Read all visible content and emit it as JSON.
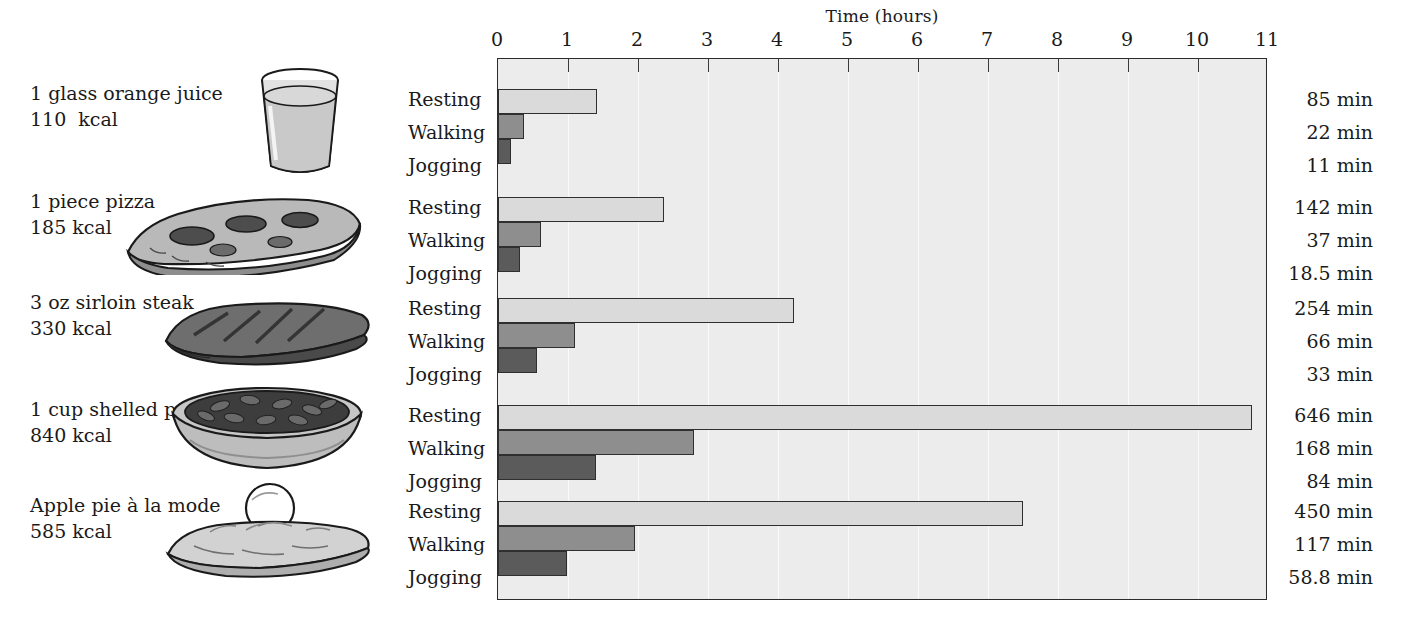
{
  "chart_data": {
    "type": "bar",
    "orientation": "horizontal",
    "title": "Time (hours)",
    "xlabel": "Time (hours)",
    "ylabel": "",
    "xlim": [
      0,
      11
    ],
    "xticks": [
      0,
      1,
      2,
      3,
      4,
      5,
      6,
      7,
      8,
      9,
      10,
      11
    ],
    "xtick_labels": [
      "0",
      "1",
      "2",
      "3",
      "4",
      "5",
      "6",
      "7",
      "8",
      "9",
      "10",
      "11"
    ],
    "grid": true,
    "legend": null,
    "categories": [
      "1 glass orange juice",
      "1 piece pizza",
      "3 oz sirloin steak",
      "1 cup shelled peanuts",
      "Apple pie à la mode"
    ],
    "series": [
      {
        "name": "Resting",
        "color": "#dadada",
        "values_hours": [
          1.417,
          2.367,
          4.233,
          10.767,
          7.5
        ],
        "values_minutes": [
          85,
          142,
          254,
          646,
          450
        ]
      },
      {
        "name": "Walking",
        "color": "#8e8e8e",
        "values_hours": [
          0.367,
          0.617,
          1.1,
          2.8,
          1.95
        ],
        "values_minutes": [
          22,
          37,
          66,
          168,
          117
        ]
      },
      {
        "name": "Jogging",
        "color": "#5b5b5b",
        "values_hours": [
          0.183,
          0.308,
          0.55,
          1.4,
          0.98
        ],
        "values_minutes": [
          11,
          18.5,
          33,
          84,
          58.8
        ]
      }
    ],
    "groups": [
      {
        "food": "1 glass orange juice",
        "calories": "110  kcal",
        "icon": "orange-juice-glass-illustration",
        "bars": [
          {
            "activity": "Resting",
            "hours": 1.417,
            "label": "85 min"
          },
          {
            "activity": "Walking",
            "hours": 0.367,
            "label": "22 min"
          },
          {
            "activity": "Jogging",
            "hours": 0.183,
            "label": "11 min"
          }
        ]
      },
      {
        "food": "1 piece pizza",
        "calories": "185 kcal",
        "icon": "pizza-slice-illustration",
        "bars": [
          {
            "activity": "Resting",
            "hours": 2.367,
            "label": "142 min"
          },
          {
            "activity": "Walking",
            "hours": 0.617,
            "label": "37 min"
          },
          {
            "activity": "Jogging",
            "hours": 0.308,
            "label": "18.5 min"
          }
        ]
      },
      {
        "food": "3 oz sirloin steak",
        "calories": "330 kcal",
        "icon": "steak-illustration",
        "bars": [
          {
            "activity": "Resting",
            "hours": 4.233,
            "label": "254 min"
          },
          {
            "activity": "Walking",
            "hours": 1.1,
            "label": "66 min"
          },
          {
            "activity": "Jogging",
            "hours": 0.55,
            "label": "33 min"
          }
        ]
      },
      {
        "food": "1 cup shelled peanuts",
        "calories": "840 kcal",
        "icon": "bowl-of-peanuts-illustration",
        "bars": [
          {
            "activity": "Resting",
            "hours": 10.767,
            "label": "646 min"
          },
          {
            "activity": "Walking",
            "hours": 2.8,
            "label": "168 min"
          },
          {
            "activity": "Jogging",
            "hours": 1.4,
            "label": "84 min"
          }
        ]
      },
      {
        "food": "Apple pie à la mode",
        "calories": "585 kcal",
        "icon": "apple-pie-a-la-mode-illustration",
        "bars": [
          {
            "activity": "Resting",
            "hours": 7.5,
            "label": "450 min"
          },
          {
            "activity": "Walking",
            "hours": 1.95,
            "label": "117 min"
          },
          {
            "activity": "Jogging",
            "hours": 0.98,
            "label": "58.8 min"
          }
        ]
      }
    ],
    "activity_labels": [
      "Resting",
      "Walking",
      "Jogging"
    ],
    "colors": {
      "plot_background": "#ececec",
      "gridline": "#fafafa",
      "frame": "#2b2b2b",
      "resting": "#dadada",
      "walking": "#8e8e8e",
      "jogging": "#5b5b5b",
      "text": "#1a1a1a"
    }
  }
}
